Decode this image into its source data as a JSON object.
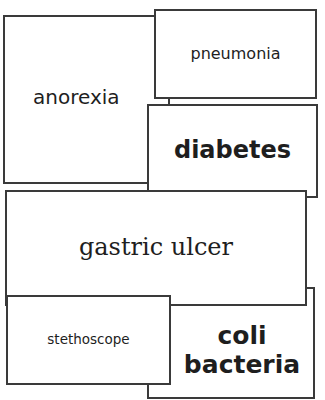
{
  "cards": {
    "anorexia": "anorexia",
    "pneumonia": "pneumonia",
    "diabetes": "diabetes",
    "gastric_ulcer": "gastric ulcer",
    "coli_bacteria_line1": "coli",
    "coli_bacteria_line2": "bacteria",
    "stethoscope": "stethoscope"
  }
}
